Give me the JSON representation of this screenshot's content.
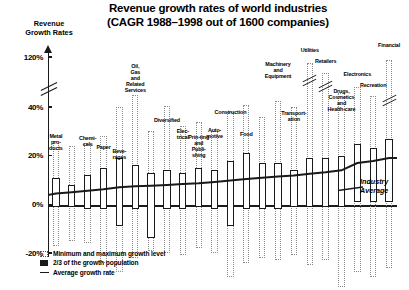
{
  "title_line1": "Revenue growth rates of world industries",
  "title_line2": "(CAGR 1988–1998 out of 1600 companies)",
  "y_axis_caption": "Revenue\nGrowth Rates",
  "industry_average_label": "Industry\nAverage",
  "legend": [
    {
      "key": "dotted-box",
      "text": "Minimum and maximum growth level"
    },
    {
      "key": "filled-box",
      "text": "2/3 of the growth population"
    },
    {
      "key": "line",
      "text": "Average growth rate"
    }
  ],
  "chart_data": {
    "type": "bar",
    "title": "Revenue growth rates of world industries (CAGR 1988–1998 out of 1600 companies)",
    "subtitle": "(CAGR 1988–1998 out of 1600 companies)",
    "xlabel": "",
    "ylabel": "Revenue Growth Rates",
    "ylim": [
      -20,
      120
    ],
    "y_ticks": [
      -20,
      0,
      20,
      40,
      120
    ],
    "y_tick_labels": [
      "-20%",
      "0%",
      "20%",
      "40%",
      "120%"
    ],
    "axis_break_between": [
      40,
      120
    ],
    "grid": false,
    "legend_position": "bottom-left",
    "series": [
      {
        "name": "Minimum and maximum growth level",
        "style": "dotted-box"
      },
      {
        "name": "2/3 of the growth population",
        "style": "solid-box"
      },
      {
        "name": "Average growth rate",
        "style": "line"
      }
    ],
    "categories": [
      "Metal pro-ducts",
      "Chemi-cals",
      "Paper",
      "Beve-rages",
      "Oil, Gas and Related Services",
      "Diversified",
      "Elec-trical",
      "Prin-ting and Publi-shing",
      "Auto-motive",
      "Construction",
      "Food",
      "Machinery and Equipment",
      "Transport-ation",
      "Utilities",
      "Retailers",
      "Drugs, Cosmetics and Health-care",
      "Electronics",
      "Recreation",
      "Financial"
    ],
    "bars": [
      {
        "label": "Metal pro-ducts",
        "min": -17,
        "max": 26,
        "q_low": -1,
        "q_high": 11,
        "avg": 4.5
      },
      {
        "label": "",
        "min": -15,
        "max": 24,
        "q_low": -1,
        "q_high": 8,
        "avg": 5.0
      },
      {
        "label": "Chemi-cals",
        "min": -16,
        "max": 25,
        "q_low": -2,
        "q_high": 12,
        "avg": 5.6
      },
      {
        "label": "Paper",
        "min": -24,
        "max": 28,
        "q_low": -2,
        "q_high": 15,
        "avg": 6.2
      },
      {
        "label": "Beve-rages",
        "min": -28,
        "max": 40,
        "q_low": -9,
        "q_high": 19,
        "avg": 7.0
      },
      {
        "label": "Oil, Gas and Related Services",
        "min": -22,
        "max": 60,
        "q_low": -2,
        "q_high": 16,
        "avg": 7.4
      },
      {
        "label": "",
        "min": -19,
        "max": 30,
        "q_low": -14,
        "q_high": 13,
        "avg": 7.6
      },
      {
        "label": "Diversified",
        "min": -20,
        "max": 42,
        "q_low": -2,
        "q_high": 14,
        "avg": 7.9
      },
      {
        "label": "Elec-trical",
        "min": -21,
        "max": 32,
        "q_low": -2,
        "q_high": 13,
        "avg": 8.3
      },
      {
        "label": "Prin-ting and Publi-shing",
        "min": -18,
        "max": 34,
        "q_low": -1,
        "q_high": 15,
        "avg": 8.7
      },
      {
        "label": "Auto-motive",
        "min": -20,
        "max": 30,
        "q_low": -2,
        "q_high": 14,
        "avg": 9.2
      },
      {
        "label": "Construction",
        "min": -30,
        "max": 38,
        "q_low": -9,
        "q_high": 18,
        "avg": 9.8
      },
      {
        "label": "Food",
        "min": -24,
        "max": 44,
        "q_low": -2,
        "q_high": 21,
        "avg": 10.4
      },
      {
        "label": "",
        "min": -22,
        "max": 36,
        "q_low": -2,
        "q_high": 17,
        "avg": 10.9
      },
      {
        "label": "Machinery and Equipment",
        "min": -23,
        "max": 50,
        "q_low": -2,
        "q_high": 17,
        "avg": 11.4
      },
      {
        "label": "Transport-ation",
        "min": -21,
        "max": 40,
        "q_low": -1,
        "q_high": 14,
        "avg": 11.9
      },
      {
        "label": "Utilities",
        "min": -25,
        "max": 110,
        "q_low": -1,
        "q_high": 19,
        "avg": 12.6
      },
      {
        "label": "Retailers",
        "min": -23,
        "max": 95,
        "q_low": -1,
        "q_high": 19,
        "avg": 13.2
      },
      {
        "label": "Drugs, Cosmetics and Health-care",
        "min": -34,
        "max": 62,
        "q_low": -1,
        "q_high": 20,
        "avg": 14.0
      },
      {
        "label": "Electronics",
        "min": -28,
        "max": 72,
        "q_low": 1,
        "q_high": 25,
        "avg": 17.0
      },
      {
        "label": "Recreation",
        "min": -30,
        "max": 58,
        "q_low": 1,
        "q_high": 23,
        "avg": 17.8
      },
      {
        "label": "Financial",
        "min": -26,
        "max": 115,
        "q_low": 1,
        "q_high": 27,
        "avg": 19.0
      }
    ]
  }
}
